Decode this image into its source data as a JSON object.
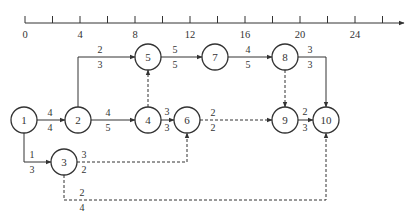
{
  "diagram": {
    "type": "time-scaled network diagram",
    "time_axis": {
      "x0": 25,
      "unit_px": 13.75,
      "y": 23,
      "max_tick": 26,
      "labels": [
        {
          "value": 0,
          "text": "0"
        },
        {
          "value": 4,
          "text": "4"
        },
        {
          "value": 8,
          "text": "8"
        },
        {
          "value": 12,
          "text": "12"
        },
        {
          "value": 16,
          "text": "16"
        },
        {
          "value": 20,
          "text": "20"
        },
        {
          "value": 24,
          "text": "24"
        }
      ],
      "minor_ticks": [
        0,
        2,
        4,
        6,
        8,
        10,
        12,
        14,
        16,
        18,
        20,
        22,
        24,
        26
      ]
    },
    "nodes": [
      {
        "id": "1",
        "label": "1",
        "x": 24,
        "y": 120
      },
      {
        "id": "2",
        "label": "2",
        "x": 78,
        "y": 120
      },
      {
        "id": "3",
        "label": "3",
        "x": 64,
        "y": 162
      },
      {
        "id": "4",
        "label": "4",
        "x": 148,
        "y": 120
      },
      {
        "id": "5",
        "label": "5",
        "x": 148,
        "y": 57
      },
      {
        "id": "6",
        "label": "6",
        "x": 187,
        "y": 120
      },
      {
        "id": "7",
        "label": "7",
        "x": 215,
        "y": 57
      },
      {
        "id": "8",
        "label": "8",
        "x": 285,
        "y": 57
      },
      {
        "id": "9",
        "label": "9",
        "x": 285,
        "y": 120
      },
      {
        "id": "10",
        "label": "10",
        "x": 326,
        "y": 120
      }
    ],
    "edges": [
      {
        "from": "1",
        "to": "2",
        "top": "4",
        "bottom": "4",
        "dashed": false,
        "path": "M37,120 L65,120",
        "lt": [
          50,
          116
        ],
        "lb": [
          50,
          131
        ]
      },
      {
        "from": "2",
        "to": "4",
        "top": "4",
        "bottom": "5",
        "dashed": false,
        "path": "M91,120 L135,120",
        "lt": [
          108,
          116
        ],
        "lb": [
          108,
          131
        ]
      },
      {
        "from": "2",
        "to": "5",
        "top": "2",
        "bottom": "3",
        "dashed": false,
        "path": "M78,107 L78,57 L135,57",
        "lt": [
          100,
          53
        ],
        "lb": [
          100,
          68
        ]
      },
      {
        "from": "4",
        "to": "5",
        "top": "",
        "bottom": "",
        "dashed": true,
        "path": "M148,107 L148,70",
        "lt": [
          0,
          0
        ],
        "lb": [
          0,
          0
        ]
      },
      {
        "from": "4",
        "to": "6",
        "top": "3",
        "bottom": "3",
        "dashed": false,
        "path": "M161,120 L174,120",
        "lt": [
          167,
          115
        ],
        "lb": [
          167,
          131
        ]
      },
      {
        "from": "5",
        "to": "7",
        "top": "5",
        "bottom": "5",
        "dashed": false,
        "path": "M161,57 L202,57",
        "lt": [
          175,
          53
        ],
        "lb": [
          175,
          68
        ]
      },
      {
        "from": "7",
        "to": "8",
        "top": "4",
        "bottom": "5",
        "dashed": false,
        "path": "M228,57 L272,57",
        "lt": [
          248,
          53
        ],
        "lb": [
          248,
          68
        ]
      },
      {
        "from": "8",
        "to": "10",
        "top": "3",
        "bottom": "3",
        "dashed": false,
        "path": "M298,57 L326,57 L326,107",
        "lt": [
          310,
          53
        ],
        "lb": [
          310,
          68
        ]
      },
      {
        "from": "8",
        "to": "9",
        "top": "",
        "bottom": "",
        "dashed": true,
        "path": "M285,70 L285,107",
        "lt": [
          0,
          0
        ],
        "lb": [
          0,
          0
        ]
      },
      {
        "from": "6",
        "to": "9",
        "top": "2",
        "bottom": "2",
        "dashed": true,
        "path": "M200,120 L272,120",
        "lt": [
          213,
          116
        ],
        "lb": [
          213,
          131
        ]
      },
      {
        "from": "9",
        "to": "10",
        "top": "2",
        "bottom": "3",
        "dashed": false,
        "path": "M298,120 L313,120",
        "lt": [
          305,
          115
        ],
        "lb": [
          305,
          131
        ]
      },
      {
        "from": "1",
        "to": "3",
        "top": "1",
        "bottom": "3",
        "dashed": false,
        "path": "M24,133 L24,162 L51,162",
        "lt": [
          32,
          158
        ],
        "lb": [
          32,
          173
        ]
      },
      {
        "from": "3",
        "to": "6",
        "top": "3",
        "bottom": "2",
        "dashed": true,
        "path": "M77,162 L187,162 L187,133",
        "lt": [
          84,
          158
        ],
        "lb": [
          84,
          173
        ]
      },
      {
        "from": "3",
        "to": "10",
        "top": "2",
        "bottom": "4",
        "dashed": true,
        "path": "M64,175 L64,200 L326,200 L326,133",
        "lt": [
          82,
          196
        ],
        "lb": [
          82,
          211
        ]
      }
    ],
    "colors": {
      "stroke": "#333333",
      "text": "#333333",
      "background": "#ffffff"
    }
  }
}
